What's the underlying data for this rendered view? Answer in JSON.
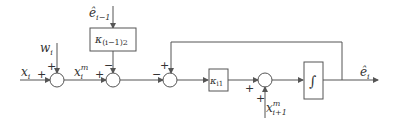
{
  "diagram": {
    "type": "block-diagram",
    "inputs": {
      "x_i": "x",
      "x_i_sub": "i",
      "w_i": "w",
      "w_i_sub": "i",
      "e_prev": "ê",
      "e_prev_sub": "i−1",
      "x_next": "x",
      "x_next_sup": "m",
      "x_next_sub": "i+1"
    },
    "signals": {
      "x_m": "x",
      "x_m_sup": "m",
      "x_m_sub": "i"
    },
    "blocks": {
      "k_prev": "κ",
      "k_prev_sub": "(i−1)2",
      "k_i1": "κ",
      "k_i1_sub": "i1",
      "integrator": "∫"
    },
    "output": {
      "e_i": "ê",
      "e_i_sub": "i"
    },
    "signs": {
      "sum1_left": "+",
      "sum1_top": "+",
      "sum2_left": "+",
      "sum2_top": "−",
      "sum3_left": "−",
      "sum3_top": "+",
      "sum4_left": "+",
      "sum4_bottom": "+"
    }
  }
}
